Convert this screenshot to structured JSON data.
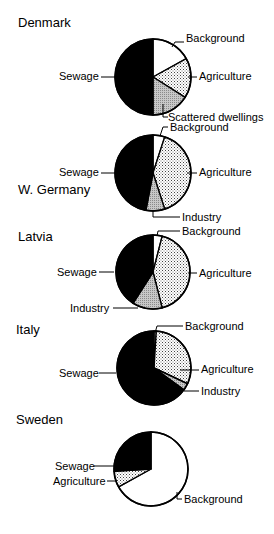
{
  "chart_data": [
    {
      "type": "pie",
      "title": "Denmark",
      "start_angle_deg": 0,
      "direction": "clockwise",
      "slices": [
        {
          "label": "Background",
          "value": 17,
          "fill": "white"
        },
        {
          "label": "Agriculture",
          "value": 17,
          "fill": "dots"
        },
        {
          "label": "Scattered dwellings",
          "value": 16,
          "fill": "grey"
        },
        {
          "label": "Sewage",
          "value": 50,
          "fill": "black"
        }
      ]
    },
    {
      "type": "pie",
      "title": "W. Germany",
      "start_angle_deg": 0,
      "direction": "clockwise",
      "slices": [
        {
          "label": "Background",
          "value": 5,
          "fill": "white"
        },
        {
          "label": "Agriculture",
          "value": 40,
          "fill": "dots"
        },
        {
          "label": "Industry",
          "value": 8,
          "fill": "grey"
        },
        {
          "label": "Sewage",
          "value": 47,
          "fill": "black"
        }
      ]
    },
    {
      "type": "pie",
      "title": "Latvia",
      "start_angle_deg": 0,
      "direction": "clockwise",
      "slices": [
        {
          "label": "Background",
          "value": 4,
          "fill": "white"
        },
        {
          "label": "Agriculture",
          "value": 42,
          "fill": "dots"
        },
        {
          "label": "Industry",
          "value": 13,
          "fill": "grey"
        },
        {
          "label": "Sewage",
          "value": 41,
          "fill": "black"
        }
      ]
    },
    {
      "type": "pie",
      "title": "Italy",
      "start_angle_deg": 0,
      "direction": "clockwise",
      "slices": [
        {
          "label": "Background",
          "value": 1,
          "fill": "white"
        },
        {
          "label": "Agriculture",
          "value": 31,
          "fill": "dots"
        },
        {
          "label": "Industry",
          "value": 3,
          "fill": "grey"
        },
        {
          "label": "Sewage",
          "value": 65,
          "fill": "black"
        }
      ]
    },
    {
      "type": "pie",
      "title": "Sweden",
      "start_angle_deg": 0,
      "direction": "clockwise",
      "slices": [
        {
          "label": "Background",
          "value": 67,
          "fill": "white"
        },
        {
          "label": "Agriculture",
          "value": 7,
          "fill": "dots"
        },
        {
          "label": "Sewage",
          "value": 26,
          "fill": "black"
        }
      ]
    }
  ],
  "layout": [
    {
      "title_pos": [
        18,
        27
      ],
      "center": [
        153,
        77
      ],
      "r": 38,
      "labels": [
        {
          "text": "Background",
          "x": 186,
          "y": 42,
          "anchor": "start",
          "line": [
            [
              172,
              47
            ],
            [
              175,
              42
            ],
            [
              184,
              42
            ]
          ]
        },
        {
          "text": "Agriculture",
          "x": 199,
          "y": 80,
          "anchor": "start",
          "line": [
            [
              188,
              77
            ],
            [
              197,
              77
            ]
          ]
        },
        {
          "text": "Scattered dwellings",
          "x": 168,
          "y": 121,
          "anchor": "start",
          "line": [
            [
              163,
              104
            ],
            [
              163,
              117
            ],
            [
              168,
              117
            ]
          ]
        },
        {
          "text": "Sewage",
          "x": 59,
          "y": 80,
          "anchor": "start",
          "line": [
            [
              101,
              77
            ],
            [
              115,
              77
            ]
          ]
        }
      ]
    },
    {
      "title_pos": [
        18,
        194
      ],
      "center": [
        153,
        173
      ],
      "r": 38,
      "labels": [
        {
          "text": "Background",
          "x": 170,
          "y": 131,
          "anchor": "start",
          "line": [
            [
              160,
              136
            ],
            [
              163,
              127
            ],
            [
              168,
              127
            ]
          ]
        },
        {
          "text": "Agriculture",
          "x": 199,
          "y": 176,
          "anchor": "start",
          "line": [
            [
              187,
              173
            ],
            [
              197,
              173
            ]
          ]
        },
        {
          "text": "Industry",
          "x": 182,
          "y": 221,
          "anchor": "start",
          "line": [
            [
              153,
              210
            ],
            [
              153,
              217
            ],
            [
              180,
              217
            ]
          ]
        },
        {
          "text": "Sewage",
          "x": 59,
          "y": 176,
          "anchor": "start",
          "line": [
            [
              101,
              173
            ],
            [
              115,
              173
            ]
          ]
        }
      ]
    },
    {
      "title_pos": [
        18,
        241
      ],
      "center": [
        153,
        272
      ],
      "r": 37,
      "labels": [
        {
          "text": "Background",
          "x": 182,
          "y": 235,
          "anchor": "start",
          "line": [
            [
              157,
              236
            ],
            [
              158,
              231
            ],
            [
              180,
              231
            ]
          ]
        },
        {
          "text": "Agriculture",
          "x": 199,
          "y": 277,
          "anchor": "start",
          "line": [
            [
              188,
              273
            ],
            [
              197,
              273
            ]
          ]
        },
        {
          "text": "Industry",
          "x": 70,
          "y": 312,
          "anchor": "start",
          "line": [
            [
              113,
              308
            ],
            [
              138,
              308
            ]
          ]
        },
        {
          "text": "Sewage",
          "x": 57,
          "y": 276,
          "anchor": "start",
          "line": [
            [
              99,
              272
            ],
            [
              114,
              272
            ]
          ]
        }
      ]
    },
    {
      "title_pos": [
        16,
        334
      ],
      "center": [
        154,
        368
      ],
      "r": 37,
      "labels": [
        {
          "text": "Background",
          "x": 185,
          "y": 330,
          "anchor": "start",
          "line": [
            [
              155,
              333
            ],
            [
              157,
              326
            ],
            [
              183,
              326
            ]
          ]
        },
        {
          "text": "Agriculture",
          "x": 201,
          "y": 373,
          "anchor": "start",
          "line": [
            [
              180,
              370
            ],
            [
              199,
              370
            ]
          ]
        },
        {
          "text": "Industry",
          "x": 201,
          "y": 395,
          "anchor": "start",
          "line": [
            [
              184,
              391
            ],
            [
              199,
              391
            ]
          ]
        },
        {
          "text": "Sewage",
          "x": 59,
          "y": 377,
          "anchor": "start",
          "line": [
            [
              99,
              373
            ],
            [
              116,
              373
            ]
          ]
        }
      ]
    },
    {
      "title_pos": [
        16,
        424
      ],
      "center": [
        151,
        469
      ],
      "r": 37,
      "labels": [
        {
          "text": "Sewage",
          "x": 55,
          "y": 470,
          "anchor": "start",
          "line": [
            [
              94,
              466
            ],
            [
              114,
              466
            ]
          ]
        },
        {
          "text": "Agriculture",
          "x": 53,
          "y": 485,
          "anchor": "start",
          "line": [
            [
              107,
              481
            ],
            [
              117,
              481
            ]
          ]
        },
        {
          "text": "Background",
          "x": 184,
          "y": 503,
          "anchor": "start",
          "line": [
            [
              177,
              492
            ],
            [
              177,
              499
            ],
            [
              182,
              499
            ]
          ]
        }
      ]
    }
  ]
}
